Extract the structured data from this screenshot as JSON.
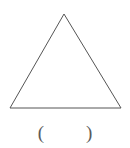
{
  "figure": {
    "type": "triangle-outline",
    "shape_name": "triangle",
    "stroke_color": "#555555",
    "fill_color": "none",
    "background_color": "#ffffff",
    "stroke_width": 1,
    "vertices": {
      "apex": {
        "x": 64,
        "y": 14
      },
      "bottom_left": {
        "x": 10,
        "y": 108
      },
      "bottom_right": {
        "x": 121,
        "y": 108
      }
    },
    "points_attr": "64,14 10,108 121,108"
  },
  "answer_blank": {
    "open_paren": "(",
    "close_paren": ")",
    "value": "",
    "placeholder": ""
  }
}
